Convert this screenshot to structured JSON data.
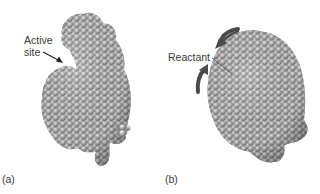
{
  "figure": {
    "panels": [
      {
        "letter": "(a)",
        "label_line1": "Active",
        "label_line2": "site",
        "description": "Enzyme space-filling model with open active site"
      },
      {
        "letter": "(b)",
        "label": "Reactant",
        "description": "Enzyme closed around reactant (induced fit), curved arrows indicate conformational change"
      }
    ],
    "colors": {
      "sphere_light": "#e6e6e6",
      "sphere_mid": "#a8a8a8",
      "sphere_dark": "#6a6a6a",
      "arrow": "#4a4a4a",
      "text": "#3a3a3a"
    }
  }
}
